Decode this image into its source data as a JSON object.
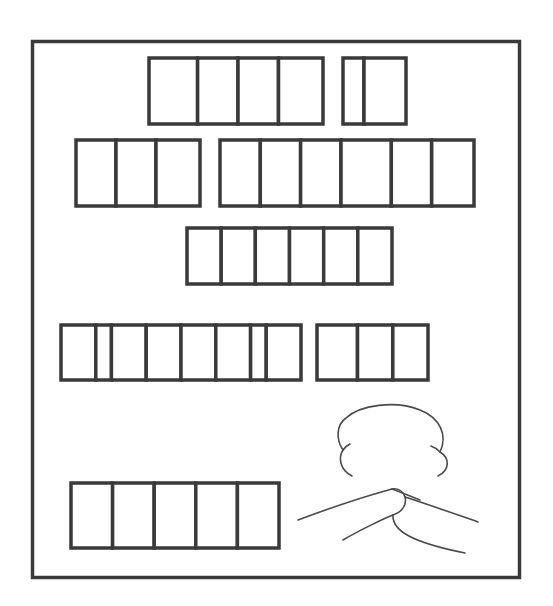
{
  "colors": {
    "stroke": "#3a3a3a",
    "background": "#ffffff",
    "box_fill": "#ffffff",
    "drawing_stroke": "#4a4a4a"
  },
  "puzzle": {
    "description": "Blank letter boxes grouped into words, with a drawing of clasped hands",
    "lines": [
      {
        "words": [
          {
            "letters": 4,
            "relative_cell_widths": [
              1.2,
              1,
              1,
              1.1
            ]
          },
          {
            "letters": 2,
            "relative_cell_widths": [
              0.5,
              1
            ]
          }
        ]
      },
      {
        "words": [
          {
            "letters": 3,
            "relative_cell_widths": [
              1,
              1,
              1.1
            ]
          },
          {
            "letters": 6,
            "relative_cell_widths": [
              1,
              1,
              1,
              1.25,
              1,
              1.05
            ]
          }
        ]
      },
      {
        "words": [
          {
            "letters": 6,
            "relative_cell_widths": [
              1,
              1,
              1,
              1,
              1,
              1
            ]
          }
        ]
      },
      {
        "words": [
          {
            "letters": 8,
            "relative_cell_widths": [
              1,
              0.45,
              1,
              1,
              1,
              1,
              0.45,
              1
            ]
          },
          {
            "letters": 3,
            "relative_cell_widths": [
              1.15,
              1,
              1
            ]
          }
        ]
      },
      {
        "words": [
          {
            "letters": 5,
            "relative_cell_widths": [
              1,
              1,
              1,
              1,
              1
            ]
          }
        ]
      }
    ],
    "illustration": "clasped-hands"
  }
}
